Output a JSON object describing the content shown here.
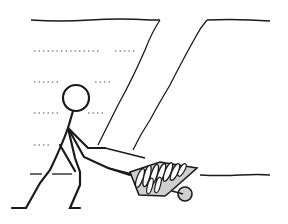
{
  "illustration": {
    "subject": "stick figure pushing a wheelbarrow full of debris along the bottom of a trench",
    "colors": {
      "background": "#ffffff",
      "ink": "#1a1a1a",
      "dots": "#555555",
      "fill_gray": "#cfcfcf"
    }
  }
}
